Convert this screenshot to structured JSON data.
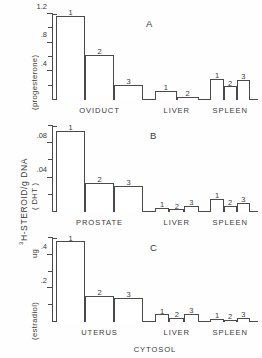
{
  "figure": {
    "axis_label_main": "H-STEROID/g DNA",
    "axis_label_superscript": "3",
    "axis_label_ug": "ug",
    "xlabel": "CYTOSOL"
  },
  "chart_data": [
    {
      "type": "bar",
      "panel": "A",
      "title": "A",
      "ylabel": "(progesterone)",
      "ylabel_shared": "3H-STEROID/g DNA",
      "ylim": [
        0,
        1.2
      ],
      "yticks": [
        0,
        0.2,
        0.4,
        0.6,
        0.8,
        1.0,
        1.2
      ],
      "ytick_labels": [
        {
          "value": 1.2,
          "label": "1.2"
        },
        {
          "value": 0.8,
          "label": ".8"
        },
        {
          "value": 0.4,
          "label": ".4"
        }
      ],
      "grid": false,
      "legend": "none",
      "groups": [
        {
          "name": "OVIDUCT",
          "bars": [
            {
              "label": "1",
              "value": 1.17
            },
            {
              "label": "2",
              "value": 0.63
            },
            {
              "label": "3",
              "value": 0.21
            }
          ]
        },
        {
          "name": "LIVER",
          "bars": [
            {
              "label": "1",
              "value": 0.13
            },
            {
              "label": "2",
              "value": 0.04
            }
          ]
        },
        {
          "name": "SPLEEN",
          "bars": [
            {
              "label": "1",
              "value": 0.3
            },
            {
              "label": "2",
              "value": 0.19
            },
            {
              "label": "3",
              "value": 0.28
            }
          ]
        }
      ]
    },
    {
      "type": "bar",
      "panel": "B",
      "title": "B",
      "ylabel": "( DHT )",
      "ylabel_shared": "3H-STEROID/g DNA",
      "ylim": [
        0,
        0.1
      ],
      "yticks": [
        0,
        0.02,
        0.04,
        0.06,
        0.08,
        0.1
      ],
      "ytick_labels": [
        {
          "value": 0.08,
          "label": ".08"
        },
        {
          "value": 0.04,
          "label": ".04"
        }
      ],
      "grid": false,
      "legend": "none",
      "groups": [
        {
          "name": "PROSTATE",
          "bars": [
            {
              "label": "1",
              "value": 0.094
            },
            {
              "label": "2",
              "value": 0.034
            },
            {
              "label": "3",
              "value": 0.03
            }
          ]
        },
        {
          "name": "LIVER",
          "bars": [
            {
              "label": "1",
              "value": 0.005
            },
            {
              "label": "2",
              "value": 0.003
            },
            {
              "label": "3",
              "value": 0.007
            }
          ]
        },
        {
          "name": "SPLEEN",
          "bars": [
            {
              "label": "1",
              "value": 0.015
            },
            {
              "label": "2",
              "value": 0.007
            },
            {
              "label": "3",
              "value": 0.011
            }
          ]
        }
      ]
    },
    {
      "type": "bar",
      "panel": "C",
      "title": "C",
      "ylabel": "(estradiol)",
      "ylabel_unit": "ug",
      "ylim": [
        0,
        0.5
      ],
      "yticks": [
        0,
        0.1,
        0.2,
        0.3,
        0.4,
        0.5
      ],
      "ytick_labels": [
        {
          "value": 0.4,
          "label": ".4"
        },
        {
          "value": 0.2,
          "label": ".2"
        }
      ],
      "grid": false,
      "legend": "none",
      "xlabel": "CYTOSOL",
      "groups": [
        {
          "name": "UTERUS",
          "bars": [
            {
              "label": "1",
              "value": 0.48
            },
            {
              "label": "2",
              "value": 0.155
            },
            {
              "label": "3",
              "value": 0.145
            }
          ]
        },
        {
          "name": "LIVER",
          "bars": [
            {
              "label": "1",
              "value": 0.045
            },
            {
              "label": "2",
              "value": 0.025
            },
            {
              "label": "3",
              "value": 0.05
            }
          ]
        },
        {
          "name": "SPLEEN",
          "bars": [
            {
              "label": "1",
              "value": 0.02
            },
            {
              "label": "2",
              "value": 0.012
            },
            {
              "label": "3",
              "value": 0.025
            }
          ]
        }
      ]
    }
  ],
  "colors": {
    "ink": "#4a4a4a",
    "text": "#3a3a3a",
    "background": "#fefefe",
    "bar_fill": "#ffffff"
  }
}
